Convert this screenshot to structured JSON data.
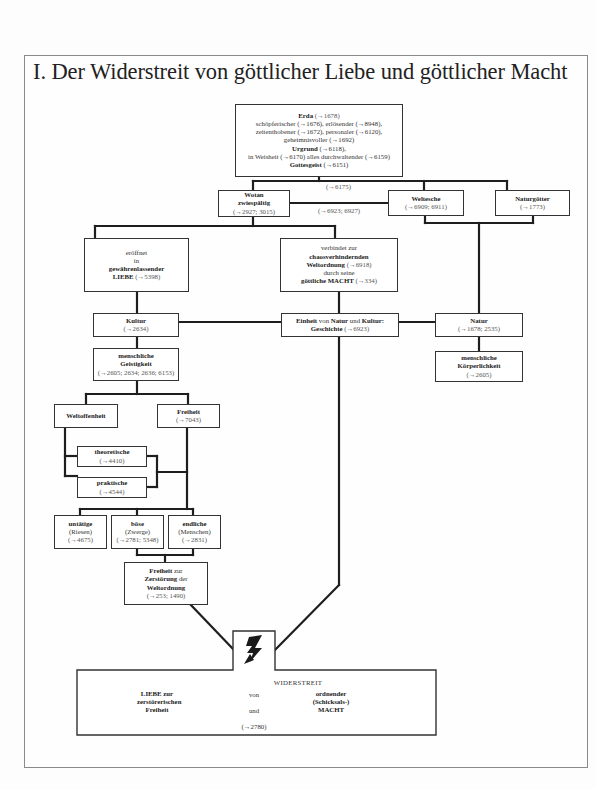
{
  "title": "I. Der Widerstreit von göttlicher Liebe und göttlicher Macht",
  "nodes": {
    "erda": {
      "name": "Erda",
      "ref": "(→1678)",
      "line2": "schöpferischer (→1676), erlösender (→8948),",
      "line3": "zeitenthobener (→1672), personaler (→6120),",
      "line4": "geheimnisvoller (→1692)",
      "urgrund": "Urgrund",
      "urgrund_ref": "(→6118),",
      "line6": "in Weisheit (→6170) alles durchwaltender (→6159)",
      "gottesgeist": "Gottesgeist",
      "gottesgeist_ref": "(→6151)"
    },
    "erda_below_ref": "(→6175)",
    "wotan": {
      "name": "Wotan",
      "sub": "zwiespältig",
      "ref": "(→2927; 3015)"
    },
    "wotan_weltesche_ref": "(→6923; 6927)",
    "weltesche": {
      "name": "Weltesche",
      "ref": "(→6909; 6911)"
    },
    "naturgoetter": {
      "name": "Naturgötter",
      "ref": "(→1773)"
    },
    "liebe": {
      "l1": "eröffnet",
      "l2": "in",
      "l3": "gewährenlassender",
      "l4": "LIEBE",
      "ref": "(→5398)"
    },
    "macht": {
      "l1": "verbindet zur",
      "l2": "chaosverhindernden",
      "l3": "Weltordnung",
      "l3_ref": "(→6918)",
      "l4": "durch seine",
      "l5": "göttliche MACHT",
      "l5_ref": "(→334)"
    },
    "kultur": {
      "name": "Kultur",
      "ref": "(→2634)"
    },
    "einheit": {
      "w1": "Einheit",
      "w2": "von",
      "w3": "Natur",
      "w4": "und",
      "w5": "Kultur:",
      "w6": "Geschichte",
      "ref": "(→6923)"
    },
    "natur": {
      "name": "Natur",
      "ref": "(→1678; 2535)"
    },
    "geistigkeit": {
      "l1": "menschliche",
      "l2": "Geistigkeit",
      "ref": "(→2605; 2634; 2636; 6153)"
    },
    "koerperlichkeit": {
      "l1": "menschliche",
      "l2": "Körperlichkeit",
      "ref": "(→2605)"
    },
    "weltoffenheit": {
      "name": "Weltoffenheit"
    },
    "freiheit": {
      "name": "Freiheit",
      "ref": "(→7043)"
    },
    "theoretische": {
      "name": "theoretische",
      "ref": "(→4410)"
    },
    "praktische": {
      "name": "praktische",
      "ref": "(→4544)"
    },
    "untaetige": {
      "name": "untätige",
      "sub": "(Riesen)",
      "ref": "(→4675)"
    },
    "boese": {
      "name": "böse",
      "sub": "(Zwerge)",
      "ref": "(→2781; 5348)"
    },
    "endliche": {
      "name": "endliche",
      "sub": "(Menschen)",
      "ref": "(→2831)"
    },
    "zerstoerung": {
      "w1": "Freiheit",
      "w2": "zur",
      "w3": "Zerstörung",
      "w4": "der",
      "w5": "Weltordnung",
      "ref": "(→253; 1490)"
    },
    "widerstreit": {
      "title": "WIDERSTREIT",
      "left": [
        "LIEBE zur",
        "zerstörerischen",
        "Freiheit"
      ],
      "center_von": "von",
      "center_und": "und",
      "right": [
        "ordnender",
        "(Schicksals-)",
        "MACHT"
      ],
      "ref": "(→2780)"
    },
    "icons": {
      "conflict": "lightning-bolt"
    }
  },
  "colors": {
    "line": "#1e1e1e",
    "box_border": "#333333",
    "frame": "#8a8a8a",
    "background": "#fdfdfd"
  }
}
